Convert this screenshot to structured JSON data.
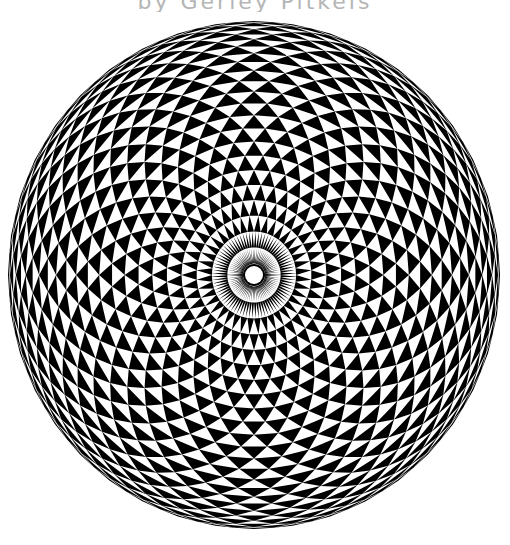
{
  "caption": {
    "text": "by Gerley Pitkeis",
    "truncated": true,
    "color": "#b5b5b5"
  },
  "artwork": {
    "description": "Black-and-white spherical checkerboard of curved triangles viewed from a pole",
    "center": [
      254,
      275
    ],
    "radius_x": 246,
    "radius_y": 254,
    "divisions": 40,
    "rings": 24,
    "inner_white_radius": 9,
    "inner_black_ring_width": 2,
    "colors": {
      "fill": "#000000",
      "background": "#ffffff"
    }
  }
}
